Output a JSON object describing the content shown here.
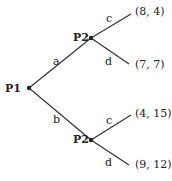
{
  "tree": {
    "root": {
      "player": "P1"
    },
    "branches": [
      {
        "action": "a",
        "node": {
          "player": "P2"
        },
        "children": [
          {
            "action": "c",
            "payoff": "(8, 4)"
          },
          {
            "action": "d",
            "payoff": "(7, 7)"
          }
        ]
      },
      {
        "action": "b",
        "node": {
          "player": "P2"
        },
        "children": [
          {
            "action": "c",
            "payoff": "(4, 15)"
          },
          {
            "action": "d",
            "payoff": "(9, 12)"
          }
        ]
      }
    ]
  },
  "colors": {
    "line": "#333333",
    "text": "#222222"
  }
}
